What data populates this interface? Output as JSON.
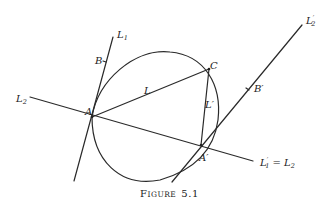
{
  "figure": {
    "caption_prefix": "F",
    "caption_rest": "IGURE",
    "caption_number": "5.1",
    "labels": {
      "L1_top": {
        "main": "L",
        "sub": "1",
        "prime": ""
      },
      "L2_left": {
        "main": "L",
        "sub": "2",
        "prime": ""
      },
      "L2p_top_right": {
        "main": "L",
        "sub": "2",
        "prime": "′"
      },
      "L1p_eq_L2": {
        "main": "L",
        "sub": "1",
        "prime": "′",
        "rest": " = L",
        "rest_sub": "2"
      },
      "L": "L",
      "Lp": "L′",
      "A": "A",
      "Ap": "A′",
      "B": "B",
      "Bp": "B′",
      "C": "C"
    }
  }
}
